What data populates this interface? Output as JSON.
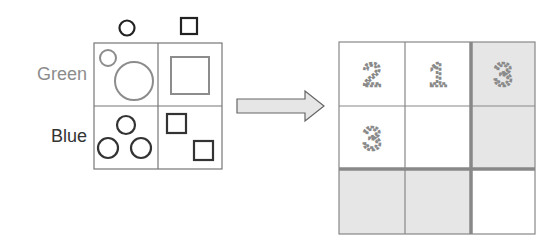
{
  "left_panel": {
    "column_headers": [
      {
        "shape": "circle",
        "icon": "circle-icon"
      },
      {
        "shape": "square",
        "icon": "square-icon"
      }
    ],
    "row_labels": [
      {
        "label": "Green",
        "color": "#8c8c8c"
      },
      {
        "label": "Blue",
        "color": "#333333"
      }
    ],
    "cells": [
      {
        "row": "Green",
        "column": "circle",
        "count": 2,
        "shape_color": "#8c8c8c"
      },
      {
        "row": "Green",
        "column": "square",
        "count": 1,
        "shape_color": "#8c8c8c"
      },
      {
        "row": "Blue",
        "column": "circle",
        "count": 3,
        "shape_color": "#333333"
      },
      {
        "row": "Blue",
        "column": "square",
        "count": 2,
        "shape_color": "#333333"
      }
    ]
  },
  "arrow": {
    "direction": "right",
    "fill": "#e6e6e6",
    "stroke": "#666666"
  },
  "right_grid": {
    "rows": 3,
    "columns": 3,
    "cells": [
      [
        "2",
        "1",
        "3"
      ],
      [
        "3",
        "",
        ""
      ],
      [
        "",
        "",
        ""
      ]
    ],
    "shaded": [
      [
        false,
        false,
        true
      ],
      [
        false,
        false,
        true
      ],
      [
        true,
        true,
        false
      ]
    ],
    "shade_color": "#e6e6e6",
    "line_color": "#888888",
    "digit_color": "#8a8a8a"
  }
}
